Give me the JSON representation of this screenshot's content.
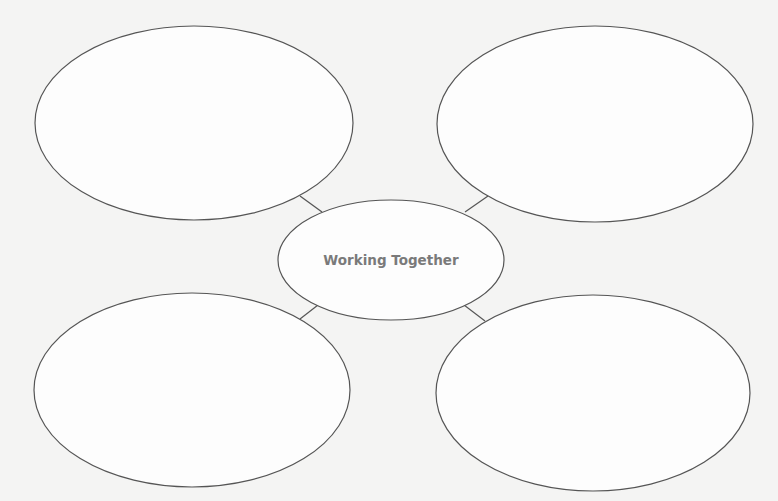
{
  "diagram": {
    "type": "bubble-map",
    "center": {
      "label": "Working Together"
    },
    "outer_bubbles": [
      {
        "position": "top-left",
        "label": ""
      },
      {
        "position": "top-right",
        "label": ""
      },
      {
        "position": "bottom-left",
        "label": ""
      },
      {
        "position": "bottom-right",
        "label": ""
      }
    ],
    "colors": {
      "background": "#f4f4f3",
      "stroke": "#555555",
      "bubble_fill": "#ffffff",
      "center_text": "#7a7a7a"
    }
  }
}
